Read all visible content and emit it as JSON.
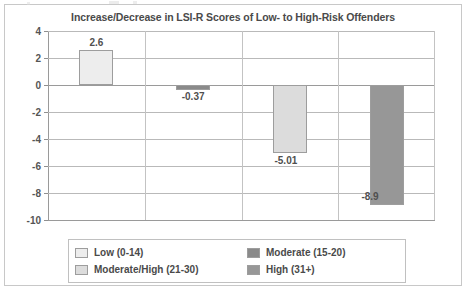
{
  "chart_data": {
    "type": "bar",
    "title": "Increase/Decrease in LSI-R Scores of Low- to High-Risk Offenders",
    "xlabel": "",
    "ylabel": "",
    "categories": [
      "Low (0-14)",
      "Moderate (15-20)",
      "Moderate/High (21-30)",
      "High (31+)"
    ],
    "values": [
      2.6,
      -0.37,
      -5.01,
      -8.9
    ],
    "data_labels": [
      "2.6",
      "-0.37",
      "-5.01",
      "-8.9"
    ],
    "ylim": [
      -10,
      4
    ],
    "yticks": [
      4,
      2,
      0,
      -2,
      -4,
      -6,
      -8,
      -10
    ],
    "ytick_labels": [
      "4",
      "2",
      "0",
      "-2",
      "-4",
      "-6",
      "-8",
      "-10"
    ],
    "grid": true,
    "legend_position": "bottom",
    "series_colors": [
      "#ededed",
      "#8a8a8a",
      "#dcdcdc",
      "#979797"
    ]
  },
  "legend": {
    "items": [
      {
        "label": "Low (0-14)",
        "color": "#ededed"
      },
      {
        "label": "Moderate (15-20)",
        "color": "#8a8a8a"
      },
      {
        "label": "Moderate/High (21-30)",
        "color": "#dcdcdc"
      },
      {
        "label": "High (31+)",
        "color": "#979797"
      }
    ]
  }
}
